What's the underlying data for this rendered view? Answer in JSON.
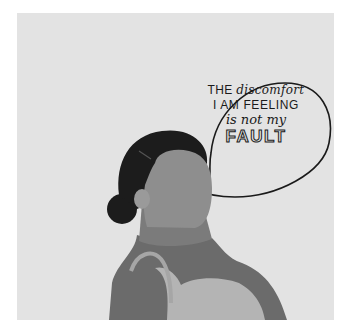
{
  "illustration": {
    "subject": "woman-profile-with-speech-bubble",
    "speech_bubble": {
      "line1_caps": "THE",
      "line1_script": "discomfort",
      "line2": "I AM FEELING",
      "line3": "is not my",
      "line4": "FAULT"
    },
    "colors": {
      "background": "#e3e3e3",
      "hair": "#1c1c1c",
      "skin": "#8e8e8e",
      "skin_dark": "#6b6b6b",
      "top": "#b4b4b4",
      "bubble_outline": "#1a1a1a"
    }
  }
}
